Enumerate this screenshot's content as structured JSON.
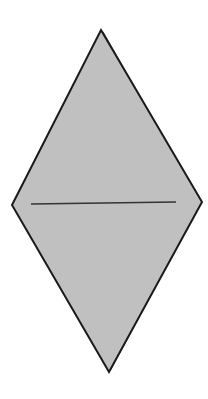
{
  "diagram": {
    "shape": "rhombus",
    "colors": {
      "background": "#ffffff",
      "fill": "#c0c0c0",
      "stroke": "#1a1a1a",
      "edge_highlight": "#555555",
      "midline": "#333333"
    },
    "vertices": {
      "top": [
        101,
        30
      ],
      "right": [
        202,
        202
      ],
      "bottom": [
        109,
        372
      ],
      "left": [
        12,
        205
      ]
    },
    "midline": {
      "x1": 31,
      "y1": 204,
      "x2": 176,
      "y2": 202
    }
  }
}
